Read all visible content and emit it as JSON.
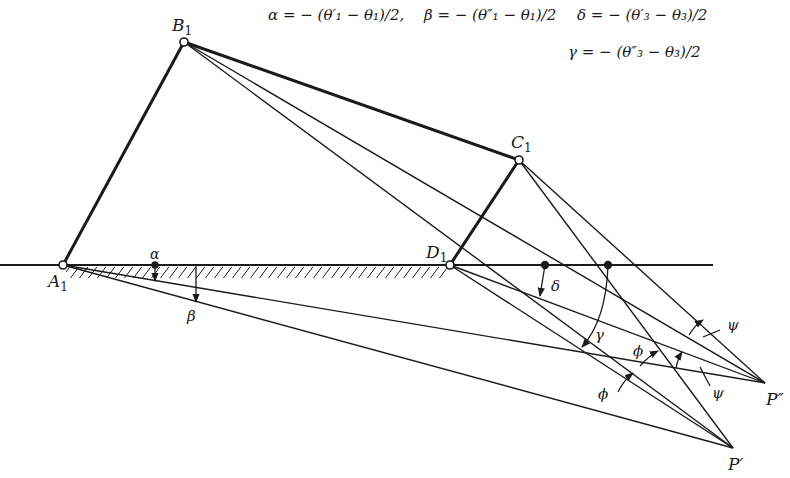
{
  "equations": {
    "alpha": "α = − (θ′₁ − θ₁)/2,",
    "beta": "β = − (θ″₁ − θ₁)/2",
    "delta": "δ = − (θ′₃ − θ₃)/2",
    "gamma": "γ = − (θ″₃ − θ₃)/2"
  },
  "points": {
    "A1": {
      "label": "A",
      "sub": "1",
      "x": 63,
      "y": 265
    },
    "B1": {
      "label": "B",
      "sub": "1",
      "x": 184,
      "y": 42
    },
    "C1": {
      "label": "C",
      "sub": "1",
      "x": 519,
      "y": 160
    },
    "D1": {
      "label": "D",
      "sub": "1",
      "x": 450,
      "y": 265
    },
    "P1": {
      "label": "P′",
      "x": 733,
      "y": 448
    },
    "P2": {
      "label": "P″",
      "x": 765,
      "y": 383
    }
  },
  "angle_labels": {
    "alpha": "α",
    "beta": "β",
    "delta": "δ",
    "gamma": "γ",
    "phi_upper": "ϕ",
    "phi_lower": "ϕ",
    "psi_upper": "ψ",
    "psi_lower": "ψ"
  },
  "colors": {
    "ink": "#1a1a1a",
    "background": "#ffffff"
  }
}
